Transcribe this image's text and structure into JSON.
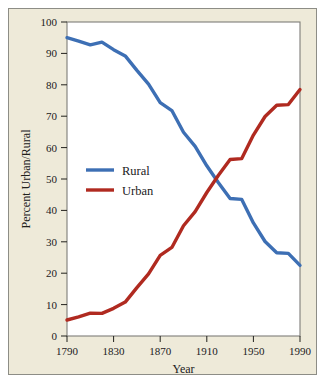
{
  "figure": {
    "background_color": "#eeead9",
    "frame_color": "#8d8d86",
    "plot_background": "#ffffff",
    "plot_border_color": "#7e7d78"
  },
  "chart_data": {
    "type": "line",
    "title": "",
    "subtitle": "",
    "xlabel": "Year",
    "ylabel": "Percent Urban/Rural",
    "xlim": [
      1790,
      1990
    ],
    "ylim": [
      0,
      100
    ],
    "grid": false,
    "legend_position": "center-left-inside",
    "x_tick_labels": [
      "1790",
      "1830",
      "1870",
      "1910",
      "1950",
      "1990"
    ],
    "x_ticks": [
      1790,
      1830,
      1870,
      1910,
      1950,
      1990
    ],
    "y_tick_labels": [
      "0",
      "10",
      "20",
      "30",
      "40",
      "50",
      "60",
      "70",
      "80",
      "90",
      "100"
    ],
    "y_ticks": [
      0,
      10,
      20,
      30,
      40,
      50,
      60,
      70,
      80,
      90,
      100
    ],
    "x": [
      1790,
      1800,
      1810,
      1820,
      1830,
      1840,
      1850,
      1860,
      1870,
      1880,
      1890,
      1900,
      1910,
      1920,
      1930,
      1940,
      1950,
      1960,
      1970,
      1980,
      1990
    ],
    "series": [
      {
        "name": "Rural",
        "color": "#3d6fb4",
        "values": [
          95.0,
          93.9,
          92.7,
          93.6,
          91.2,
          89.2,
          84.6,
          80.2,
          74.3,
          71.8,
          64.9,
          60.4,
          54.2,
          48.8,
          43.8,
          43.5,
          36.0,
          30.1,
          26.5,
          26.3,
          22.5
        ]
      },
      {
        "name": "Urban",
        "color": "#b02a20",
        "values": [
          5.1,
          6.1,
          7.3,
          7.2,
          8.8,
          10.8,
          15.4,
          19.8,
          25.7,
          28.2,
          35.1,
          39.6,
          45.7,
          51.2,
          56.2,
          56.5,
          64.0,
          69.9,
          73.5,
          73.7,
          78.5
        ]
      }
    ],
    "annotations": []
  },
  "legend": {
    "entries": [
      {
        "label": "Rural",
        "color": "#3d6fb4"
      },
      {
        "label": "Urban",
        "color": "#b02a20"
      }
    ]
  }
}
